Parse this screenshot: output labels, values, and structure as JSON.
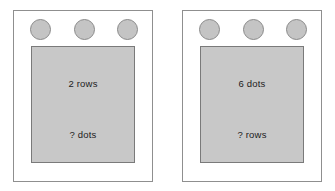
{
  "figure": {
    "background_color": "#ffffff",
    "panel_border_color": "#8f8f8f",
    "card_fill_color": "#c8c8c8",
    "card_border_color": "#7a7a7a",
    "dot_fill_color": "#c4c4c4",
    "dot_border_color": "#8a8a8a"
  },
  "panels": [
    {
      "id": "left-panel",
      "dots": [
        {
          "name": "dot-1"
        },
        {
          "name": "dot-2"
        },
        {
          "name": "dot-3"
        }
      ],
      "dot_count": 3,
      "card": {
        "top_label": "2 rows",
        "bottom_label": "? dots"
      }
    },
    {
      "id": "right-panel",
      "dots": [
        {
          "name": "dot-1"
        },
        {
          "name": "dot-2"
        },
        {
          "name": "dot-3"
        }
      ],
      "dot_count": 3,
      "card": {
        "top_label": "6 dots",
        "bottom_label": "? rows"
      }
    }
  ]
}
